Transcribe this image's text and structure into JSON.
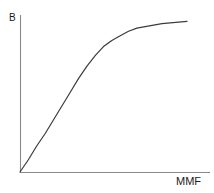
{
  "chart_data": {
    "type": "line",
    "title": "",
    "subtitle": "",
    "xlabel": "MMF",
    "ylabel": "B",
    "grid": false,
    "legend": null,
    "xlim": [
      0,
      1
    ],
    "ylim": [
      0,
      1
    ],
    "axis_ticks": {
      "x": [],
      "y": []
    },
    "annotations": [],
    "series": [
      {
        "name": "magnetization-curve",
        "color": "#3c3c3c",
        "x": [
          0.0,
          0.05,
          0.1,
          0.15,
          0.2,
          0.25,
          0.3,
          0.35,
          0.4,
          0.45,
          0.5,
          0.55,
          0.6,
          0.65,
          0.7,
          0.75,
          0.8,
          0.85,
          0.9,
          0.95,
          1.0
        ],
        "y": [
          0.0,
          0.08,
          0.17,
          0.25,
          0.34,
          0.43,
          0.52,
          0.61,
          0.69,
          0.76,
          0.82,
          0.86,
          0.89,
          0.92,
          0.94,
          0.95,
          0.96,
          0.97,
          0.975,
          0.98,
          0.985
        ]
      }
    ]
  },
  "labels": {
    "y_axis": "B",
    "x_axis": "MMF"
  },
  "colors": {
    "background": "#ffffff",
    "axis": "#8a8a8a",
    "curve": "#3c3c3c",
    "text": "#1a1a1a"
  }
}
